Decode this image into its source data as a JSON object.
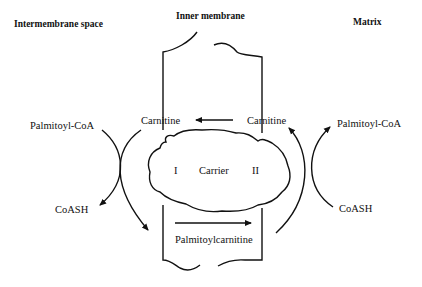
{
  "headers": {
    "left": "Intermembrane space",
    "center": "Inner membrane",
    "right": "Matrix"
  },
  "left_reaction": {
    "substrate": "Palmitoyl-CoA",
    "product": "CoASH"
  },
  "right_reaction": {
    "substrate": "CoASH",
    "product": "Palmitoyl-CoA"
  },
  "membrane": {
    "carnitine_left": "Carnitine",
    "carnitine_right": "Carnitine",
    "carrier_label": "Carrier",
    "site_one": "I",
    "site_two": "II",
    "transported": "Palmitoylcarnitine"
  },
  "colors": {
    "line": "#111111",
    "background": "#ffffff"
  }
}
